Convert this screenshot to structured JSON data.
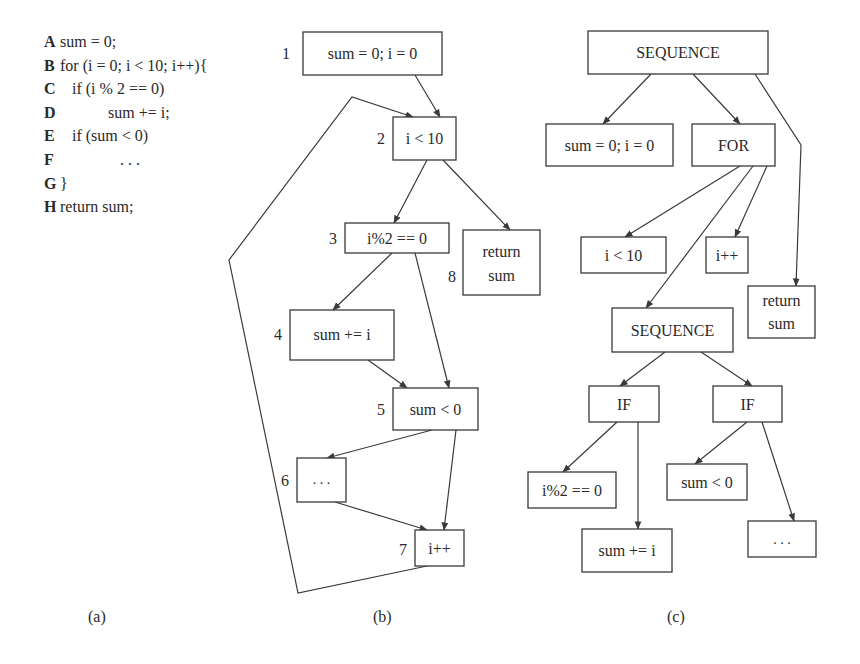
{
  "code": {
    "lines": [
      {
        "label": "A",
        "text": "sum = 0;"
      },
      {
        "label": "B",
        "text": "for (i = 0; i < 10; i++){"
      },
      {
        "label": "C",
        "text": "   if (i % 2 == 0)"
      },
      {
        "label": "D",
        "text": "            sum += i;"
      },
      {
        "label": "E",
        "text": "   if (sum < 0)"
      },
      {
        "label": "F",
        "text": "               . . ."
      },
      {
        "label": "G",
        "text": "}"
      },
      {
        "label": "H",
        "text": "return sum;"
      }
    ]
  },
  "cfg": {
    "nodes": [
      {
        "id": "1",
        "text": "sum = 0; i = 0"
      },
      {
        "id": "2",
        "text": "i < 10"
      },
      {
        "id": "3",
        "text": "i%2 == 0"
      },
      {
        "id": "4",
        "text": "sum += i"
      },
      {
        "id": "5",
        "text": "sum < 0"
      },
      {
        "id": "6",
        "text": ". . ."
      },
      {
        "id": "7",
        "text": "i++"
      },
      {
        "id": "8",
        "text_line1": "return",
        "text_line2": "sum"
      }
    ]
  },
  "ast": {
    "root": "SEQUENCE",
    "init": "sum = 0; i = 0",
    "for": "FOR",
    "cond": "i < 10",
    "incr": "i++",
    "ret_line1": "return",
    "ret_line2": "sum",
    "body_seq": "SEQUENCE",
    "if1": "IF",
    "if2": "IF",
    "if1_cond": "i%2 == 0",
    "if1_body": "sum += i",
    "if2_cond": "sum < 0",
    "if2_body": ". . ."
  },
  "captions": {
    "a": "(a)",
    "b": "(b)",
    "c": "(c)"
  }
}
